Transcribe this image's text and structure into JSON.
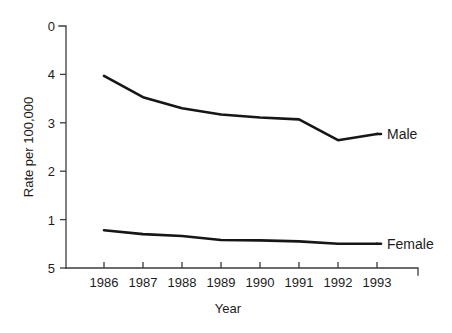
{
  "chart_data": {
    "type": "line",
    "title": "",
    "xlabel": "Year",
    "ylabel": "Rate per 100,000",
    "categories": [
      "1986",
      "1987",
      "1988",
      "1989",
      "1990",
      "1991",
      "1992",
      "1993"
    ],
    "x": [
      1986,
      1987,
      1988,
      1989,
      1990,
      1991,
      1992,
      1993
    ],
    "xlim": [
      1986,
      1993
    ],
    "ylim": [
      0,
      5
    ],
    "yticks": [
      "0",
      "1",
      "2",
      "3",
      "4",
      "5"
    ],
    "ytick_values": [
      0,
      1,
      2,
      3,
      4,
      5
    ],
    "grid": false,
    "legend_position": "right-inline-labels",
    "series": [
      {
        "name": "Male",
        "label": "Male",
        "color": "#161616",
        "values": [
          3.97,
          3.53,
          3.3,
          3.17,
          3.11,
          3.07,
          2.64,
          2.77
        ]
      },
      {
        "name": "Female",
        "label": "Female",
        "color": "#161616",
        "values": [
          0.78,
          0.7,
          0.66,
          0.58,
          0.57,
          0.55,
          0.5,
          0.5
        ]
      }
    ]
  },
  "axes": {
    "y_axis_title": "Rate per 100,000",
    "x_axis_title": "Year"
  },
  "annotations": {
    "male_label": "Male",
    "female_label": "Female"
  }
}
